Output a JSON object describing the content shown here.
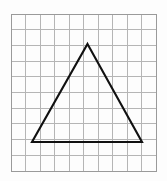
{
  "figure": {
    "type": "geometry-diagram",
    "background_color": "#fdfdfd",
    "canvas": {
      "width": 167,
      "height": 181
    }
  },
  "grid": {
    "name": "square-grid",
    "columns": 10,
    "rows": 10,
    "x0": 11,
    "y0": 14,
    "x1": 156,
    "y1": 171,
    "cell_width": 14.5,
    "cell_height": 15.7,
    "line_color": "#b5b5b5",
    "border_color": "#9a9a9a",
    "line_width": 1
  },
  "shape": {
    "name": "triangle",
    "kind": "isosceles-triangle",
    "stroke_color": "#111111",
    "stroke_width": 2.1,
    "fill": "none",
    "vertices": [
      {
        "label": "apex",
        "x": 87.5,
        "y": 44.0
      },
      {
        "label": "bottom-right",
        "x": 142.0,
        "y": 142.0
      },
      {
        "label": "bottom-left",
        "x": 32.0,
        "y": 142.0
      }
    ],
    "grid_vertices": [
      {
        "label": "apex",
        "col": 5.28,
        "row": 1.91
      },
      {
        "label": "bottom-right",
        "col": 9.03,
        "row": 8.15
      },
      {
        "label": "bottom-left",
        "col": 1.45,
        "row": 8.15
      }
    ],
    "base_length_px": 110,
    "height_px": 98
  },
  "chart_data": {
    "type": "scatter",
    "xlabel": "",
    "ylabel": "",
    "xlim": [
      0,
      10
    ],
    "ylim": [
      0,
      10
    ],
    "grid": true,
    "legend": "none",
    "series": [
      {
        "name": "triangle",
        "x": [
          1.45,
          9.03,
          5.28,
          1.45
        ],
        "y": [
          1.85,
          1.85,
          8.09,
          1.85
        ]
      }
    ]
  }
}
